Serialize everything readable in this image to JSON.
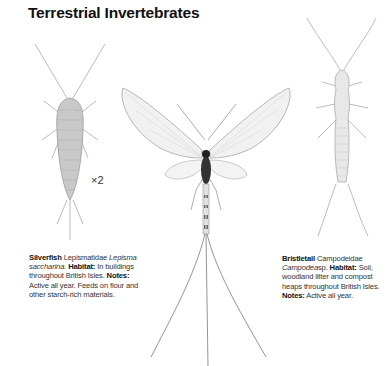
{
  "page": {
    "title": "Terrestrial Invertebrates"
  },
  "illustrations": [
    {
      "name": "silverfish",
      "scale": "×2"
    },
    {
      "name": "mayfly"
    },
    {
      "name": "bristletail"
    }
  ],
  "species": [
    {
      "common_name": "Silverfish",
      "family": "Lepismatidae",
      "latin_name": "Lepisma saccharina.",
      "habitat_label": "Habitat:",
      "habitat": "In buildings throughout British Isles.",
      "notes_label": "Notes:",
      "notes": "Active all year. Feeds on flour and other starch-rich materials."
    },
    {
      "common_name": "Bristletail",
      "family": "Campodeidae",
      "latin_name": "Campodea",
      "latin_suffix": "sp.",
      "habitat_label": "Habitat:",
      "habitat": "Soil, woodland litter and compost heaps throughout British Isles.",
      "notes_label": "Notes:",
      "notes": "Active all year."
    }
  ]
}
